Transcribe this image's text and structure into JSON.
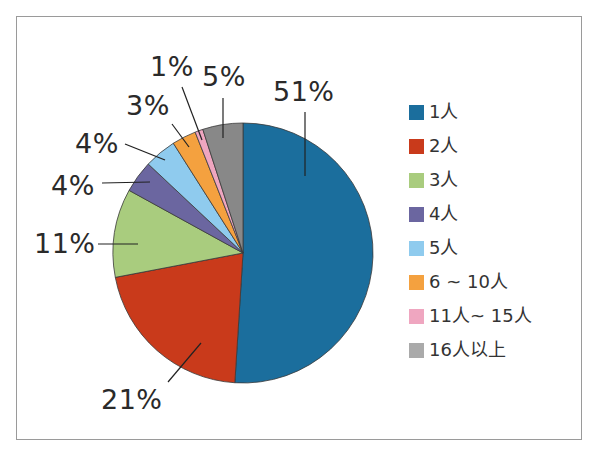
{
  "chart_data": {
    "type": "pie",
    "title": "",
    "start_angle_deg": 0,
    "direction": "clockwise",
    "categories": [
      "1人",
      "2人",
      "3人",
      "4人",
      "5人",
      "6 ~ 10人",
      "11人~ 15人",
      "16人以上"
    ],
    "values": [
      51,
      21,
      11,
      4,
      4,
      3,
      1,
      5
    ],
    "value_labels": [
      "51%",
      "21%",
      "11%",
      "4%",
      "4%",
      "3%",
      "1%",
      "5%"
    ],
    "colors": [
      "#1b6e9d",
      "#c93a1b",
      "#a9cc7e",
      "#6b66a0",
      "#8fcbee",
      "#f4a13f",
      "#efa6c0",
      "#888888"
    ],
    "legend_colors": [
      "#1b6e9d",
      "#c93a1b",
      "#a9cc7e",
      "#6b66a0",
      "#8fcbee",
      "#f4a13f",
      "#efa6c0",
      "#aaaaaa"
    ],
    "legend_position": "right",
    "unit": "%"
  },
  "labels": {
    "l0": "51%",
    "l1": "21%",
    "l2": "11%",
    "l3": "4%",
    "l4": "4%",
    "l5": "3%",
    "l6": "1%",
    "l7": "5%"
  },
  "legend": {
    "items": [
      {
        "label": "1人"
      },
      {
        "label": "2人"
      },
      {
        "label": "3人"
      },
      {
        "label": "4人"
      },
      {
        "label": "5人"
      },
      {
        "label": "6 ~ 10人"
      },
      {
        "label": "11人~ 15人"
      },
      {
        "label": "16人以上"
      }
    ]
  }
}
